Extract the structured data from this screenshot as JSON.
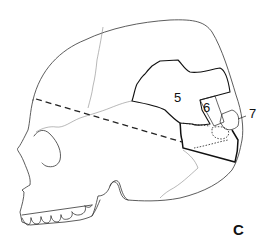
{
  "figure": {
    "panel_label": "C",
    "region_labels": [
      {
        "id": "5",
        "text": "5"
      },
      {
        "id": "6",
        "text": "6"
      },
      {
        "id": "7",
        "text": "7"
      }
    ],
    "line_color": "#222222",
    "background": "#ffffff"
  }
}
